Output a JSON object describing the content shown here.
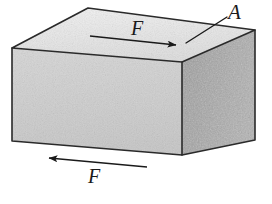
{
  "figure": {
    "caption": "",
    "background_color": "#ffffff",
    "line_color": "#1a1a1a",
    "labels": {
      "area": "A",
      "force_top": "F",
      "force_bottom": "F"
    },
    "icons": {
      "area_leader_line": "leader-line",
      "top_force_arrow": "arrow-right-icon",
      "bottom_force_arrow": "arrow-left-icon"
    },
    "block": {
      "name": "rectangular-block",
      "faces": {
        "top": {
          "name": "top-face",
          "color": "#ebebeb",
          "label": "A"
        },
        "front": {
          "name": "front-face",
          "color": "#cfcfcf"
        },
        "right": {
          "name": "right-face",
          "color": "#a8a8a8"
        }
      },
      "geometry": {
        "top_face_points": "12,48 88,8 255,30 182,62",
        "front_face_points": "12,48 182,62 182,155 12,141",
        "right_face_points": "182,62 255,30 255,140 182,155"
      }
    },
    "annotations": [
      {
        "name": "top-force-arrow",
        "label": "F",
        "direction": "right",
        "from": "90,36",
        "to": "181,46"
      },
      {
        "name": "bottom-force-arrow",
        "label": "F",
        "direction": "left",
        "from": "147,167",
        "to": "43,158"
      },
      {
        "name": "area-leader-line",
        "label": "A",
        "from": "226,18",
        "to": "187,42"
      }
    ]
  }
}
